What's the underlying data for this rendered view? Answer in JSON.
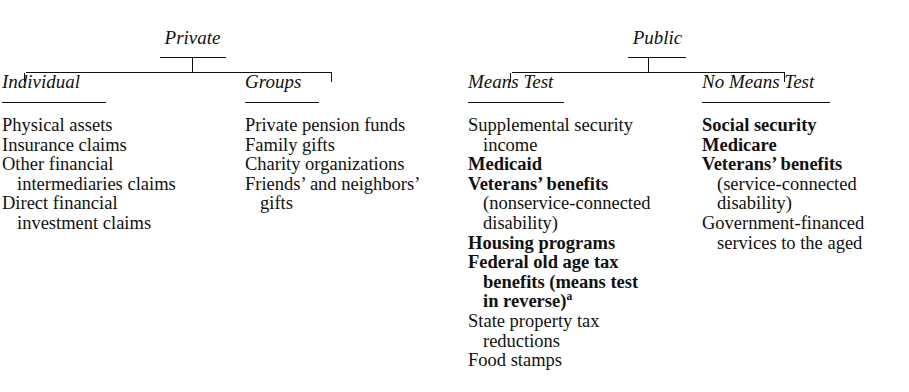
{
  "diagram": {
    "branches": [
      {
        "root": "Private",
        "columns": [
          {
            "heading": "Individual",
            "items": [
              {
                "lines": [
                  {
                    "text": "Physical assets",
                    "bold": false,
                    "cont": false
                  }
                ]
              },
              {
                "lines": [
                  {
                    "text": "Insurance claims",
                    "bold": false,
                    "cont": false
                  }
                ]
              },
              {
                "lines": [
                  {
                    "text": "Other financial",
                    "bold": false,
                    "cont": false
                  },
                  {
                    "text": "intermediaries claims",
                    "bold": false,
                    "cont": true
                  }
                ]
              },
              {
                "lines": [
                  {
                    "text": "Direct financial",
                    "bold": false,
                    "cont": false
                  },
                  {
                    "text": "investment claims",
                    "bold": false,
                    "cont": true
                  }
                ]
              }
            ]
          },
          {
            "heading": "Groups",
            "items": [
              {
                "lines": [
                  {
                    "text": "Private pension funds",
                    "bold": false,
                    "cont": false
                  }
                ]
              },
              {
                "lines": [
                  {
                    "text": "Family gifts",
                    "bold": false,
                    "cont": false
                  }
                ]
              },
              {
                "lines": [
                  {
                    "text": "Charity organizations",
                    "bold": false,
                    "cont": false
                  }
                ]
              },
              {
                "lines": [
                  {
                    "text": "Friends’ and neighbors’",
                    "bold": false,
                    "cont": false
                  },
                  {
                    "text": "gifts",
                    "bold": false,
                    "cont": true
                  }
                ]
              }
            ]
          }
        ]
      },
      {
        "root": "Public",
        "columns": [
          {
            "heading": "Means Test",
            "items": [
              {
                "lines": [
                  {
                    "text": "Supplemental security",
                    "bold": false,
                    "cont": false
                  },
                  {
                    "text": "income",
                    "bold": false,
                    "cont": true
                  }
                ]
              },
              {
                "lines": [
                  {
                    "text": "Medicaid",
                    "bold": true,
                    "cont": false
                  }
                ]
              },
              {
                "lines": [
                  {
                    "text": "Veterans’ benefits",
                    "bold": true,
                    "cont": false
                  },
                  {
                    "text": "(nonservice-connected",
                    "bold": false,
                    "cont": true
                  },
                  {
                    "text": "disability)",
                    "bold": false,
                    "cont": true
                  }
                ]
              },
              {
                "lines": [
                  {
                    "text": "Housing programs",
                    "bold": true,
                    "cont": false
                  }
                ]
              },
              {
                "lines": [
                  {
                    "text": "Federal old age tax",
                    "bold": true,
                    "cont": false
                  },
                  {
                    "text": "benefits (means test",
                    "bold": true,
                    "cont": true
                  },
                  {
                    "text": "in reverse)",
                    "bold": true,
                    "cont": true,
                    "sup": "a"
                  }
                ]
              },
              {
                "lines": [
                  {
                    "text": "State property tax",
                    "bold": false,
                    "cont": false
                  },
                  {
                    "text": "reductions",
                    "bold": false,
                    "cont": true
                  }
                ]
              },
              {
                "lines": [
                  {
                    "text": "Food stamps",
                    "bold": false,
                    "cont": false
                  }
                ]
              }
            ]
          },
          {
            "heading": "No Means Test",
            "items": [
              {
                "lines": [
                  {
                    "text": "Social security",
                    "bold": true,
                    "cont": false
                  }
                ]
              },
              {
                "lines": [
                  {
                    "text": "Medicare",
                    "bold": true,
                    "cont": false
                  }
                ]
              },
              {
                "lines": [
                  {
                    "text": "Veterans’ benefits",
                    "bold": true,
                    "cont": false
                  },
                  {
                    "text": "(service-connected",
                    "bold": false,
                    "cont": true
                  },
                  {
                    "text": "disability)",
                    "bold": false,
                    "cont": true
                  }
                ]
              },
              {
                "lines": [
                  {
                    "text": "Government-financed",
                    "bold": false,
                    "cont": false
                  },
                  {
                    "text": "services to the aged",
                    "bold": false,
                    "cont": true
                  }
                ]
              }
            ]
          }
        ]
      }
    ]
  }
}
